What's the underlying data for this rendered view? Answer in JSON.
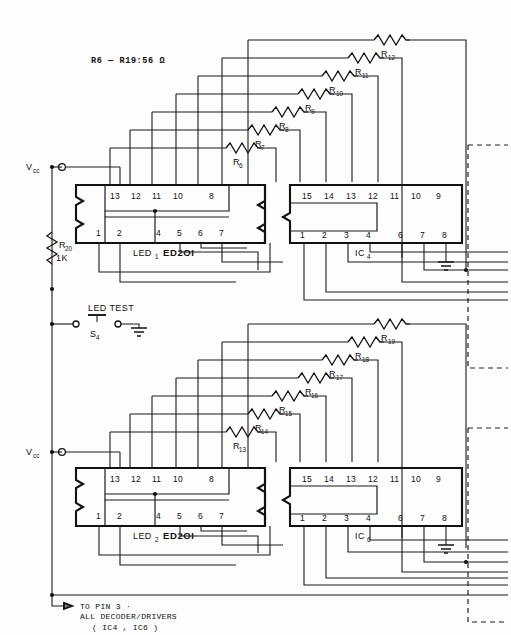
{
  "diagram": {
    "title_note": "R6 — R19:56 Ω",
    "footer_note_line1": "TO PIN 3  ·",
    "footer_note_line2": "ALL DECODER/DRIVERS",
    "footer_note_line3": "( IC4 , IC6 )",
    "colors": {
      "background": "#fdfdfd",
      "wire": "#1b1b1b",
      "outline": "#111111",
      "text": "#111111"
    }
  },
  "power": {
    "vcc_top_label": "V",
    "vcc_top_sub": "cc",
    "vcc_bottom_label": "V",
    "vcc_bottom_sub": "cc"
  },
  "bias": {
    "ref": "R",
    "ref_sub": "20",
    "value": "1K"
  },
  "test_switch": {
    "label": "LED  TEST",
    "designator": "S",
    "designator_sub": "4"
  },
  "resistors_top": [
    {
      "ref": "R",
      "sub": "6"
    },
    {
      "ref": "R",
      "sub": "7"
    },
    {
      "ref": "R",
      "sub": "8"
    },
    {
      "ref": "R",
      "sub": "9"
    },
    {
      "ref": "R",
      "sub": "10"
    },
    {
      "ref": "R",
      "sub": "11"
    },
    {
      "ref": "R",
      "sub": "12"
    }
  ],
  "resistors_bottom": [
    {
      "ref": "R",
      "sub": "13"
    },
    {
      "ref": "R",
      "sub": "14"
    },
    {
      "ref": "R",
      "sub": "15"
    },
    {
      "ref": "R",
      "sub": "16"
    },
    {
      "ref": "R",
      "sub": "17"
    },
    {
      "ref": "R",
      "sub": "18"
    },
    {
      "ref": "R",
      "sub": "19"
    }
  ],
  "displays": [
    {
      "designator": "LED",
      "designator_sub": "1",
      "part": "ED2OI",
      "pins_top": [
        "13",
        "12",
        "11",
        "10",
        "8"
      ],
      "pins_bottom": [
        "1",
        "2",
        "4",
        "5",
        "6",
        "7"
      ]
    },
    {
      "designator": "LED",
      "designator_sub": "2",
      "part": "ED2OI",
      "pins_top": [
        "13",
        "12",
        "11",
        "10",
        "8"
      ],
      "pins_bottom": [
        "1",
        "2",
        "4",
        "5",
        "6",
        "7"
      ]
    }
  ],
  "ics": [
    {
      "designator": "IC",
      "designator_sub": "4",
      "pins_top": [
        "15",
        "14",
        "13",
        "12",
        "11",
        "10",
        "9"
      ],
      "pins_bottom": [
        "1",
        "2",
        "3",
        "4",
        "6",
        "7",
        "8"
      ]
    },
    {
      "designator": "IC",
      "designator_sub": "6",
      "pins_top": [
        "15",
        "14",
        "13",
        "12",
        "11",
        "10",
        "9"
      ],
      "pins_bottom": [
        "1",
        "2",
        "3",
        "4",
        "6",
        "7",
        "8"
      ]
    }
  ]
}
